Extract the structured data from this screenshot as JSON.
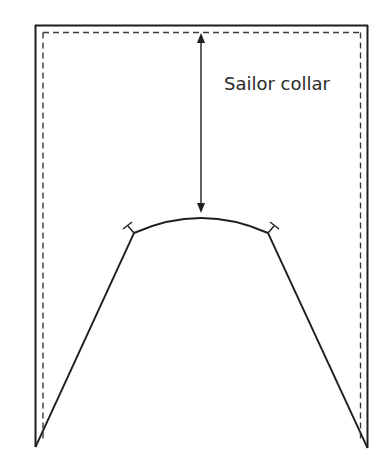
{
  "diagram": {
    "label": "Sailor collar",
    "colors": {
      "stroke": "#1e1e1e",
      "dashed": "#3a3a3a",
      "text": "#2a2a2a",
      "background": "#ffffff"
    },
    "outline": {
      "left_x": 35,
      "right_x": 368,
      "top_y": 25,
      "bottom_left_y": 447,
      "bottom_right_y": 448
    },
    "seam_allowance": {
      "style": "dashed",
      "left_x": 43,
      "right_x": 361,
      "top_y": 32
    },
    "neckline": {
      "left_point": [
        134,
        233
      ],
      "apex": [
        201,
        213
      ],
      "right_point": [
        268,
        233
      ]
    },
    "arrow": {
      "x": 201,
      "from_y": 33,
      "to_y": 213,
      "type": "double-headed"
    },
    "notches": [
      {
        "name": "left-shoulder-notch",
        "at": [
          134,
          233
        ]
      },
      {
        "name": "right-shoulder-notch",
        "at": [
          268,
          233
        ]
      }
    ]
  }
}
